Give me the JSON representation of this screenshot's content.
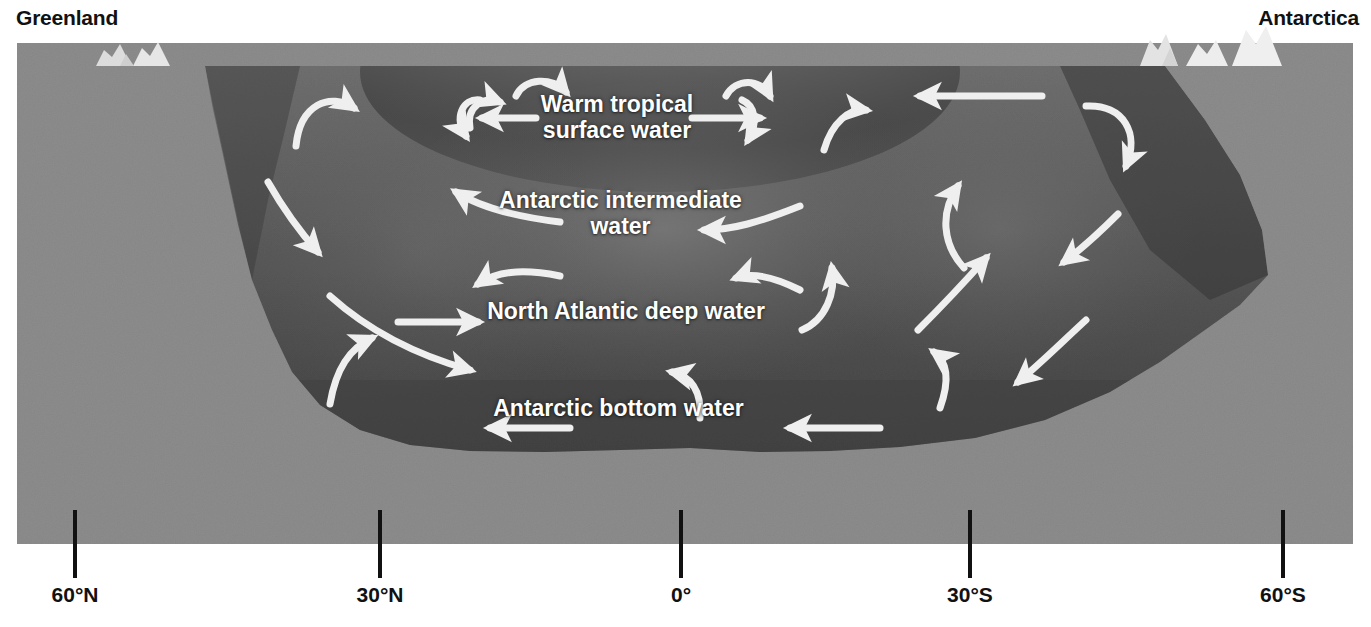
{
  "figure": {
    "kind": "ocean-circulation-cross-section",
    "title_left": "Greenland",
    "title_right": "Antarctica"
  },
  "colors": {
    "page_background": "#ffffff",
    "seafloor_gray": "#8c8c8c",
    "ocean_deep": "#4a4a4a",
    "ocean_mid": "#5e5e5e",
    "ocean_upper": "#6e6e6e",
    "land_gray": "#8a8a8a",
    "ice_white": "#e8e8e8",
    "arrow_white": "#efefef",
    "text_dark": "#111111",
    "text_light": "#ffffff"
  },
  "water_masses": [
    {
      "id": "warm-tropical-surface-water",
      "label": "Warm tropical\nsurface water",
      "depth_band": "surface"
    },
    {
      "id": "antarctic-intermediate-water",
      "label": "Antarctic intermediate\nwater",
      "depth_band": "intermediate"
    },
    {
      "id": "north-atlantic-deep-water",
      "label": "North Atlantic deep water",
      "depth_band": "deep"
    },
    {
      "id": "antarctic-bottom-water",
      "label": "Antarctic bottom water",
      "depth_band": "bottom"
    }
  ],
  "axis": {
    "name": "latitude",
    "ticks": [
      {
        "label": "60°N",
        "x": 75
      },
      {
        "label": "30°N",
        "x": 380
      },
      {
        "label": "0°",
        "x": 681
      },
      {
        "label": "30°S",
        "x": 970
      },
      {
        "label": "60°S",
        "x": 1283
      }
    ]
  },
  "chart_data": {
    "type": "diagram",
    "xlabel": "latitude",
    "ylabel": "depth",
    "categories": [
      "60°N",
      "30°N",
      "0°",
      "30°S",
      "60°S"
    ],
    "series": [
      {
        "name": "Warm tropical surface water",
        "values": [
          0,
          0,
          0,
          0,
          0
        ]
      },
      {
        "name": "Antarctic intermediate water",
        "values": [
          1,
          1,
          1,
          1,
          1
        ]
      },
      {
        "name": "North Atlantic deep water",
        "values": [
          2,
          2,
          2,
          2,
          2
        ]
      },
      {
        "name": "Antarctic bottom water",
        "values": [
          3,
          3,
          3,
          3,
          3
        ]
      }
    ]
  }
}
